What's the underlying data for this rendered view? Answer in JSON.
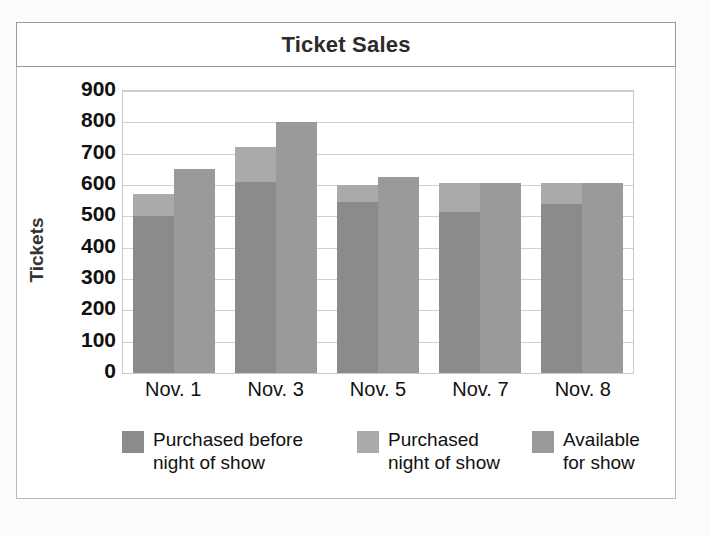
{
  "chart_data": {
    "type": "bar",
    "title": "Ticket Sales",
    "xlabel": "",
    "ylabel": "Tickets",
    "categories": [
      "Nov. 1",
      "Nov. 3",
      "Nov. 5",
      "Nov. 7",
      "Nov. 8"
    ],
    "ylim": [
      0,
      900
    ],
    "yticks": [
      900,
      800,
      700,
      600,
      500,
      400,
      300,
      200,
      100,
      0
    ],
    "grid": true,
    "legend_position": "bottom",
    "stacked": "series 1 and 2 are stacked; series 3 is a separate adjacent bar",
    "series": [
      {
        "name": "Purchased before night of show",
        "name_line1": "Purchased before",
        "name_line2": "night of show",
        "color": "#8b8b8b",
        "values": [
          500,
          610,
          545,
          515,
          540
        ]
      },
      {
        "name": "Purchased night of show",
        "name_line1": "Purchased",
        "name_line2": "night of show",
        "color": "#aaaaaa",
        "values": [
          70,
          110,
          55,
          90,
          65
        ],
        "cumulative_tops": [
          570,
          720,
          600,
          605,
          605
        ]
      },
      {
        "name": "Available for show",
        "name_line1": "Available",
        "name_line2": "for show",
        "color": "#9a9a9a",
        "values": [
          650,
          800,
          625,
          605,
          605
        ]
      }
    ]
  },
  "colors": {
    "series1": "#8b8b8b",
    "series2": "#aaaaaa",
    "series3": "#9a9a9a",
    "grid": "#d0d0d0",
    "border": "#b8b8b8",
    "text": "#111111",
    "page_background": "#fbfbfb"
  }
}
